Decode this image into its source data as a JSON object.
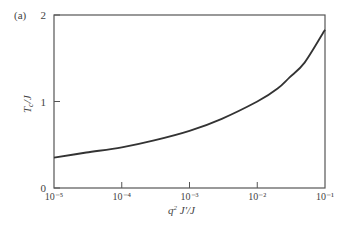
{
  "panel_label": "(a)",
  "chart_data": {
    "type": "line",
    "title": "",
    "panel": "(a)",
    "xlabel": "q² J′/J",
    "ylabel": "T_c/J",
    "xscale": "log",
    "xlim": [
      1e-05,
      0.1
    ],
    "ylim": [
      0,
      2
    ],
    "x_ticks": [
      "10⁻⁵",
      "10⁻⁴",
      "10⁻³",
      "10⁻²",
      "10⁻¹"
    ],
    "y_ticks": [
      "0",
      "1",
      "2"
    ],
    "grid": false,
    "legend": null,
    "series": [
      {
        "name": "T_c/J",
        "x": [
          1e-05,
          3e-05,
          0.0001,
          0.0003,
          0.001,
          0.003,
          0.01,
          0.02,
          0.03,
          0.05,
          0.1
        ],
        "y": [
          0.35,
          0.41,
          0.47,
          0.55,
          0.66,
          0.8,
          1.0,
          1.15,
          1.28,
          1.45,
          1.83
        ]
      }
    ]
  },
  "axis": {
    "xlabel_main": "q",
    "xlabel_sup": "2",
    "xlabel_rest": " J′/J",
    "ylabel_main": "T",
    "ylabel_sub": "c",
    "ylabel_rest": "/J"
  }
}
